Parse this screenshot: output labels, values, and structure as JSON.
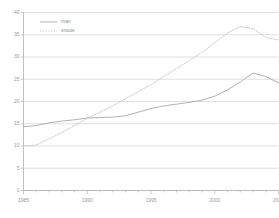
{
  "chart_data": {
    "type": "line",
    "title": "",
    "xlabel": "",
    "ylabel": "",
    "xlim": [
      1985,
      2005
    ],
    "ylim": [
      0,
      40
    ],
    "grid": true,
    "legend_position": "top-left",
    "x_tick_labels": [
      "1985",
      "1990",
      "1995",
      "2000",
      "2005"
    ],
    "x_tick_values": [
      1985,
      1990,
      1995,
      2000,
      2005
    ],
    "x_minor_ticks": [
      1985,
      1986,
      1987,
      1988,
      1989,
      1990,
      1991,
      1992,
      1993,
      1994,
      1995,
      1996,
      1997,
      1998,
      1999,
      2000,
      2001,
      2002,
      2003,
      2004,
      2005
    ],
    "y_tick_labels": [
      "0",
      "5",
      "10",
      "15",
      "20",
      "25",
      "30",
      "35",
      "40"
    ],
    "y_tick_values": [
      0,
      5,
      10,
      15,
      20,
      25,
      30,
      35,
      40
    ],
    "x": [
      1985,
      1986,
      1987,
      1988,
      1989,
      1990,
      1991,
      1992,
      1993,
      1994,
      1995,
      1996,
      1997,
      1998,
      1999,
      2000,
      2001,
      2002,
      2003,
      2004,
      2005
    ],
    "series": [
      {
        "name": "man",
        "style": "solid",
        "color": "#a8a8a8",
        "values": [
          14.3,
          14.6,
          15.2,
          15.6,
          15.9,
          16.3,
          16.4,
          16.5,
          16.8,
          17.6,
          18.4,
          19.0,
          19.4,
          19.8,
          20.3,
          21.2,
          22.6,
          24.4,
          26.4,
          25.6,
          24.2
        ]
      },
      {
        "name": "vrouw",
        "style": "dotted",
        "color": "#bdbdbd",
        "values": [
          10.0,
          10.2,
          11.6,
          13.0,
          14.6,
          16.2,
          17.6,
          19.0,
          20.6,
          22.2,
          23.8,
          25.6,
          27.4,
          29.2,
          31.0,
          33.2,
          35.4,
          36.8,
          36.4,
          34.4,
          33.8
        ]
      }
    ]
  },
  "legend": {
    "items": [
      {
        "label": "man",
        "style": "solid"
      },
      {
        "label": "vrouw",
        "style": "dotted"
      }
    ]
  },
  "colors": {
    "background": "#ffffff",
    "grid": "#c9c9c9",
    "axis": "#b0b0b0",
    "text": "#9a9a9a",
    "series_man": "#a8a8a8",
    "series_vrouw": "#bdbdbd"
  }
}
